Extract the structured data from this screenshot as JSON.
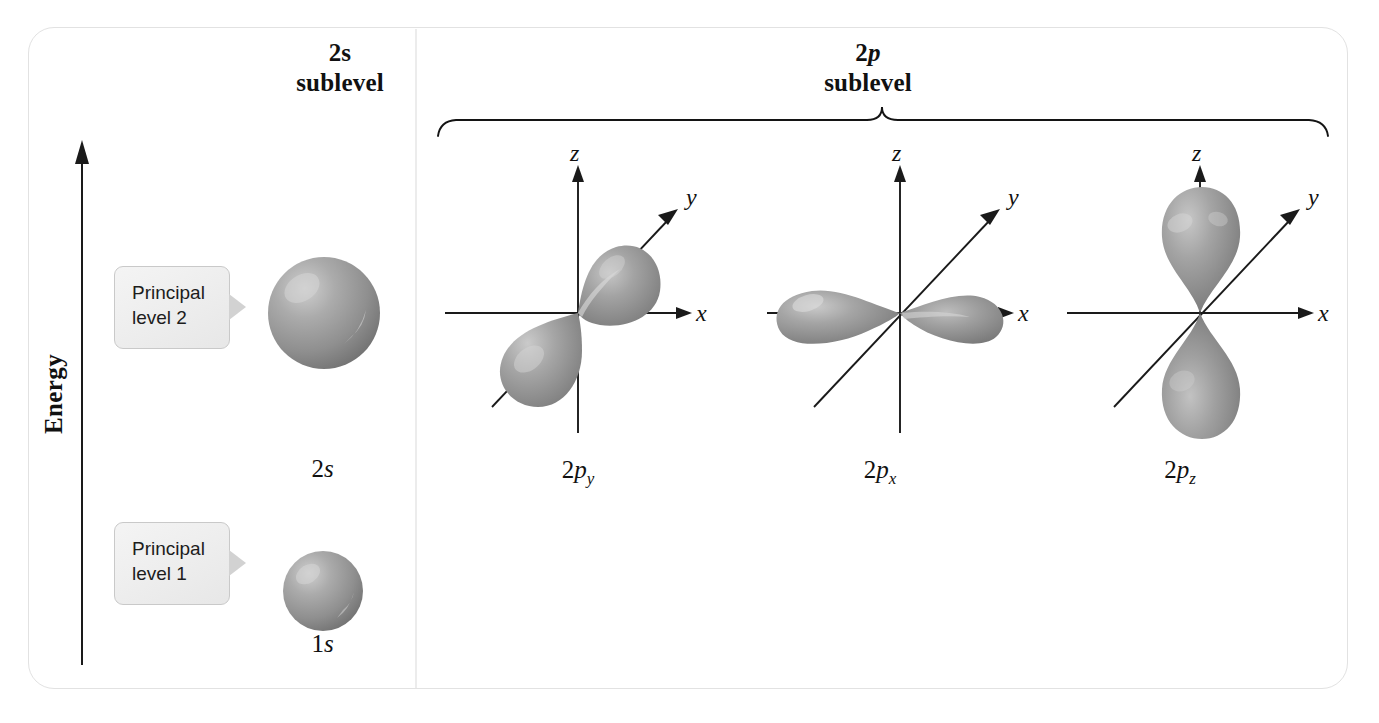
{
  "figure": {
    "title_2s": {
      "orbital": "2s",
      "word": "sublevel"
    },
    "title_2p": {
      "orbital_prefix": "2",
      "orbital_italic": "p",
      "word": "sublevel"
    },
    "energy_axis_label": "Energy"
  },
  "callouts": [
    {
      "line1": "Principal",
      "line2": "level 2"
    },
    {
      "line1": "Principal",
      "line2": "level 1"
    }
  ],
  "orbitals": [
    {
      "name": "2s",
      "prefix": "2",
      "letter": "s",
      "subscript": "",
      "shape": "sphere",
      "sublevel": "2s"
    },
    {
      "name": "1s",
      "prefix": "1",
      "letter": "s",
      "subscript": "",
      "shape": "sphere",
      "sublevel": "1s"
    },
    {
      "name": "2py",
      "prefix": "2",
      "letter": "p",
      "subscript": "y",
      "shape": "dumbbell",
      "sublevel": "2p"
    },
    {
      "name": "2px",
      "prefix": "2",
      "letter": "p",
      "subscript": "x",
      "shape": "dumbbell",
      "sublevel": "2p"
    },
    {
      "name": "2pz",
      "prefix": "2",
      "letter": "p",
      "subscript": "z",
      "shape": "dumbbell",
      "sublevel": "2p"
    }
  ],
  "axis_letters": {
    "x": "x",
    "y": "y",
    "z": "z"
  },
  "colors": {
    "orbital_gray": "#9a9a9a",
    "orbital_highlight": "#d8d8d8",
    "orbital_shadow": "#6e6e6e",
    "axis_line": "#1a1a1a",
    "panel_border": "#e2e2e2",
    "divider": "#ececec",
    "callout_fill": "#eeeeee",
    "callout_border": "#c9c9c9",
    "text": "#111111",
    "background": "#ffffff"
  }
}
